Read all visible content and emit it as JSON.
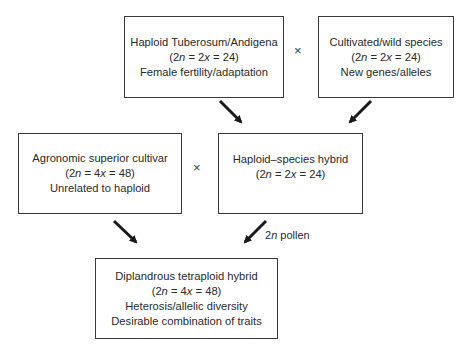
{
  "boxes": {
    "haploid_tuberosum": {
      "title": "Haploid Tuberosum/Andigena",
      "ploidy_prefix": "(2",
      "ploidy_n": "n",
      "ploidy_mid": " = 2",
      "ploidy_x": "x",
      "ploidy_suffix": " = 24)",
      "trait": "Female fertility/adaptation"
    },
    "wild_species": {
      "title": "Cultivated/wild species",
      "ploidy_prefix": "(2",
      "ploidy_n": "n",
      "ploidy_mid": " = 2",
      "ploidy_x": "x",
      "ploidy_suffix": " = 24)",
      "trait": "New genes/alleles"
    },
    "superior_cultivar": {
      "title": "Agronomic superior cultivar",
      "ploidy_prefix": "(2",
      "ploidy_n": "n",
      "ploidy_mid": " = 4",
      "ploidy_x": "x",
      "ploidy_suffix": " = 48)",
      "trait": "Unrelated to haploid"
    },
    "haploid_species_hybrid": {
      "title": "Haploid–species hybrid",
      "ploidy_prefix": "(2",
      "ploidy_n": "n",
      "ploidy_mid": " = 2",
      "ploidy_x": "x",
      "ploidy_suffix": " = 24)"
    },
    "tetraploid_hybrid": {
      "title": "Diplandrous tetraploid hybrid",
      "ploidy_prefix": "(2",
      "ploidy_n": "n",
      "ploidy_mid": " = 4",
      "ploidy_x": "x",
      "ploidy_suffix": " = 48)",
      "trait1": "Heterosis/allelic diversity",
      "trait2": "Desirable combination of traits"
    }
  },
  "cross_symbol": "×",
  "pollen_label": {
    "prefix": "2",
    "n": "n",
    "suffix": " pollen"
  },
  "colors": {
    "stroke": "#3a3a3a",
    "arrow": "#1a1a1a",
    "text": "#2a2a2a"
  }
}
